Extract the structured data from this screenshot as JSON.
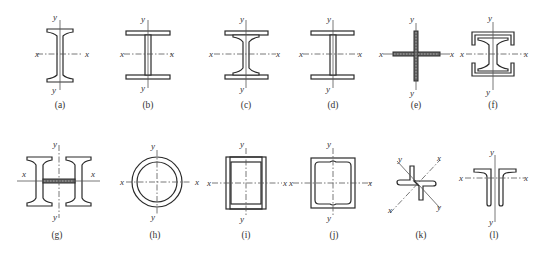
{
  "figure": {
    "axis_labels": {
      "x": "x",
      "y": "y"
    },
    "panels": [
      {
        "id": "a",
        "caption": "(a)",
        "shape": "rolled-i-beam-tapered-flange"
      },
      {
        "id": "b",
        "caption": "(b)",
        "shape": "welded-i-section"
      },
      {
        "id": "c",
        "caption": "(c)",
        "shape": "rolled-i-beam-with-cover-plates"
      },
      {
        "id": "d",
        "caption": "(d)",
        "shape": "welded-i-section-wide"
      },
      {
        "id": "e",
        "caption": "(e)",
        "shape": "cruciform-plates"
      },
      {
        "id": "f",
        "caption": "(f)",
        "shape": "i-beam-with-two-channels"
      },
      {
        "id": "g",
        "caption": "(g)",
        "shape": "double-i-beam-with-batten"
      },
      {
        "id": "h",
        "caption": "(h)",
        "shape": "circular-tube"
      },
      {
        "id": "i",
        "caption": "(i)",
        "shape": "welded-box-plates"
      },
      {
        "id": "j",
        "caption": "(j)",
        "shape": "box-with-two-channels"
      },
      {
        "id": "k",
        "caption": "(k)",
        "shape": "cruciform-double-angle"
      },
      {
        "id": "l",
        "caption": "(l)",
        "shape": "double-angle-t-section"
      }
    ]
  }
}
